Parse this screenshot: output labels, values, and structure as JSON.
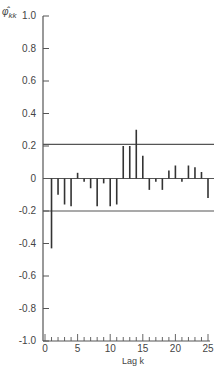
{
  "chart_data": {
    "type": "bar",
    "title": "",
    "xlabel": "Lag k",
    "ylabel": "φ̂kk",
    "ylabel_main": "φ̂",
    "ylabel_sub": "kk",
    "xlim": [
      0,
      25
    ],
    "ylim": [
      -1.0,
      1.0
    ],
    "grid": false,
    "legend": null,
    "x_ticks": [
      0,
      5,
      10,
      15,
      20,
      25
    ],
    "x_tick_labels": [
      "0",
      "5",
      "10",
      "15",
      "20",
      "25"
    ],
    "y_ticks": [
      1.0,
      0.8,
      0.6,
      0.4,
      0.2,
      0,
      -0.2,
      -0.4,
      -0.6,
      -0.8,
      -1.0
    ],
    "y_tick_labels": [
      "1.0",
      "0.8",
      "0.6",
      "0.4",
      "0.2",
      "0",
      "-0.2",
      "-0.4",
      "-0.6",
      "-0.8",
      "-1.0"
    ],
    "categories": [
      1,
      2,
      3,
      4,
      5,
      6,
      7,
      8,
      9,
      10,
      11,
      12,
      13,
      14,
      15,
      16,
      17,
      18,
      19,
      20,
      21,
      22,
      23,
      24,
      25
    ],
    "values": [
      -0.43,
      -0.1,
      -0.16,
      -0.17,
      0.035,
      -0.02,
      -0.06,
      -0.17,
      -0.03,
      -0.17,
      -0.16,
      0.2,
      0.2,
      0.3,
      0.14,
      -0.07,
      -0.02,
      -0.07,
      0.05,
      0.08,
      -0.02,
      0.08,
      0.07,
      0.04,
      -0.12
    ],
    "confidence_limits": {
      "upper": 0.21,
      "lower": -0.2
    },
    "annotations": []
  },
  "colors": {
    "axis": "#555555",
    "bars": "#333333",
    "limits": "#555555"
  }
}
